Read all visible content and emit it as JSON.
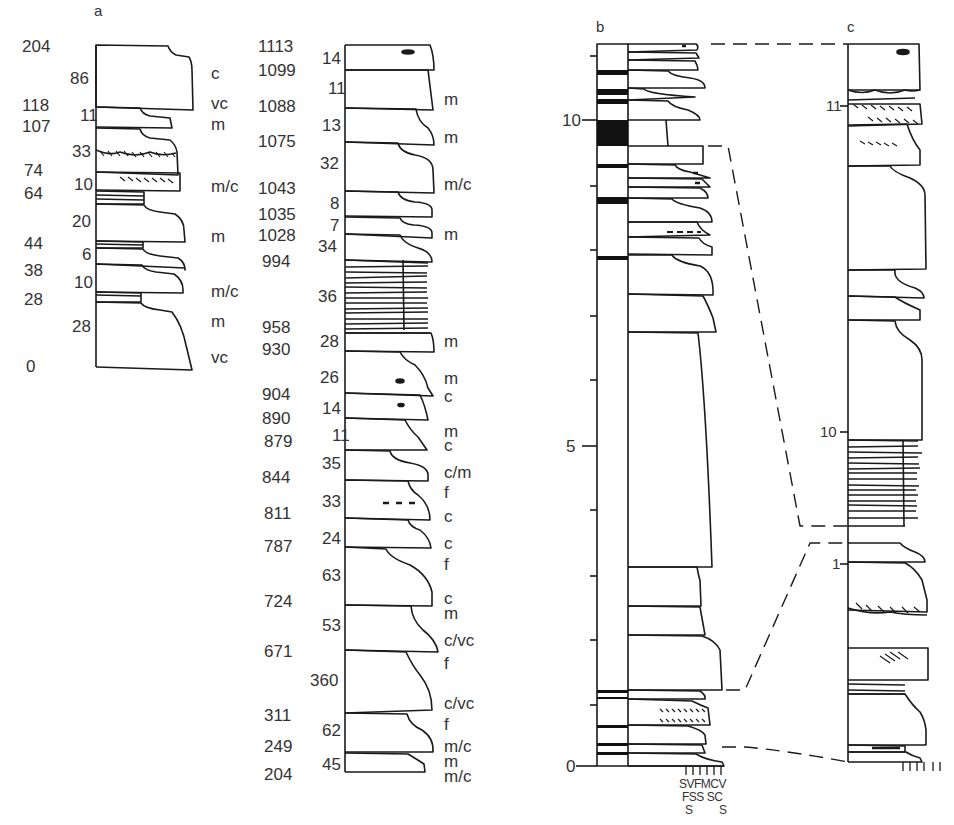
{
  "figure": {
    "type": "stratigraphic_sedimentary_logs",
    "panels": [
      "a",
      "b",
      "c"
    ]
  },
  "panel_a": {
    "letter": "a",
    "cumulative_depths": [
      "204",
      "118",
      "107",
      "74",
      "64",
      "44",
      "38",
      "28",
      "0"
    ],
    "bed_thicknesses": [
      "86",
      "11",
      "33",
      "10",
      "20",
      "6",
      "10",
      "28"
    ],
    "grain_sizes": [
      "c",
      "vc",
      "m",
      "m/c",
      "m",
      "m/c",
      "m",
      "vc"
    ]
  },
  "panel_a2": {
    "cumulative_depths": [
      "1113",
      "1099",
      "1088",
      "1075",
      "1043",
      "1035",
      "1028",
      "994",
      "958",
      "930",
      "904",
      "890",
      "879",
      "844",
      "811",
      "787",
      "724",
      "671",
      "311",
      "249",
      "204"
    ],
    "bed_thicknesses": [
      "14",
      "11",
      "13",
      "32",
      "8",
      "7",
      "34",
      "36",
      "28",
      "26",
      "14",
      "11",
      "35",
      "33",
      "24",
      "63",
      "53",
      "360",
      "62",
      "45"
    ],
    "grain_sizes": [
      "m",
      "m",
      "m/c",
      "m",
      "m",
      "m",
      "c",
      "m",
      "c",
      "c/m",
      "f",
      "c",
      "c",
      "f",
      "c",
      "m",
      "c/vc",
      "f",
      "c/vc",
      "f",
      "m/c",
      "m",
      "m/c"
    ]
  },
  "panel_b": {
    "letter": "b",
    "scale_labels": [
      "10",
      "5",
      "0"
    ],
    "grain_scale_row1": "SVFMCV",
    "grain_scale_row2": "FSS SC",
    "grain_scale_row3a": "S",
    "grain_scale_row3b": "S"
  },
  "panel_c": {
    "letter": "c",
    "scale_labels": [
      "11",
      "10",
      "1"
    ]
  }
}
